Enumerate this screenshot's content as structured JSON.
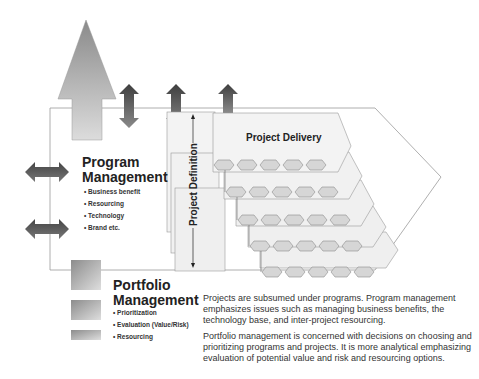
{
  "program": {
    "title_line1": "Program",
    "title_line2": "Management",
    "bullets": [
      "Business benefit",
      "Resourcing",
      "Technology",
      "Brand etc."
    ]
  },
  "portfolio": {
    "title_line1": "Portfolio",
    "title_line2": "Management",
    "bullets": [
      "Prioritization",
      "Evaluation (Value/Risk)",
      "Resourcing"
    ]
  },
  "project": {
    "delivery_label": "Project Delivery",
    "definition_label": "Project Definition",
    "stack_rows": 5,
    "hexagons_per_row": 5
  },
  "descriptions": [
    "Projects are subsumed under programs. Program management emphasizes  issues such as managing business benefits, the technology base, and inter-project resourcing.",
    "Portfolio management is concerned with decisions on choosing and prioritizing programs and projects. It is more analytical emphasizing evaluation of potential value and risk and resourcing options."
  ],
  "colors": {
    "frame_line": "#9a9a9a",
    "panel_fill": "#f0f0f0",
    "hex_fill": "#d6d6d6",
    "arrow_dark": "#555555",
    "arrow_light": "#cfcfcf"
  }
}
